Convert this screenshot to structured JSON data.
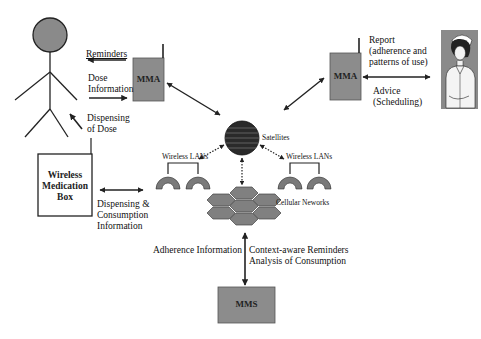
{
  "diagram": {
    "title": "",
    "colors": {
      "box_fill": "#8c8c8c",
      "head_fill": "#8a8a8a",
      "globe_fill": "#2a2a2a",
      "hex_fill": "#808080",
      "lan_fill": "#7a7a7a",
      "line": "#222222",
      "background": "#ffffff"
    },
    "nodes": {
      "patient": {
        "icon": "stick-figure-icon"
      },
      "mma_left": {
        "label": "MMA"
      },
      "mma_right": {
        "label": "MMA"
      },
      "nurse": {
        "icon": "nurse-portrait-icon"
      },
      "medication_box": {
        "line1": "Wireless",
        "line2": "Medication",
        "line3": "Box"
      },
      "satellites": {
        "label": "Satellites",
        "icon": "globe-icon"
      },
      "lan_left": {
        "label": "Wireless LANs",
        "icon": "wireless-lan-icon"
      },
      "lan_right": {
        "label": "Wireless LANs",
        "icon": "wireless-lan-icon"
      },
      "cellular": {
        "label": "Cellular Neworks",
        "icon": "hexagon-cells-icon"
      },
      "mms": {
        "label": "MMS"
      }
    },
    "edges": {
      "reminders": {
        "label": "Reminders",
        "from": "MMA",
        "to": "Patient"
      },
      "dose_information": {
        "line1": "Dose",
        "line2": "Information",
        "from": "Patient",
        "to": "MMA"
      },
      "dispensing_of_dose": {
        "line1": "Dispensing",
        "line2": "of Dose",
        "from": "Wireless Medication Box",
        "to": "Patient"
      },
      "dispensing_consumption": {
        "line1": "Dispensing &",
        "line2": "Consumption",
        "line3": "Information"
      },
      "report": {
        "line1": "Report",
        "line2": "(adherence and",
        "line3": "patterns of use)"
      },
      "advice": {
        "line1": "Advice",
        "line2": "(Scheduling)"
      },
      "adherence_information": {
        "label": "Adherence Information"
      },
      "context_aware": {
        "line1": "Context-aware Reminders",
        "line2": "Analysis of Consumption"
      }
    }
  }
}
